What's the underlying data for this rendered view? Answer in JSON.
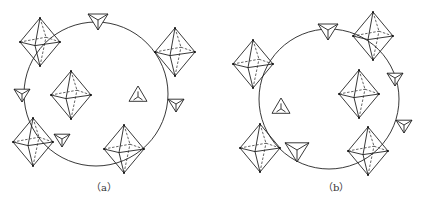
{
  "figure": {
    "panels": [
      {
        "label": "（a）",
        "circle": {
          "cx": 96,
          "cy": 94,
          "r": 72
        },
        "octahedra": [
          [
            40,
            42,
            20,
            24
          ],
          [
            175,
            52,
            20,
            24
          ],
          [
            71,
            95,
            20,
            24
          ],
          [
            33,
            142,
            20,
            24
          ],
          [
            124,
            149,
            20,
            24
          ]
        ],
        "tetrahedra_out": [
          [
            98,
            20,
            10
          ],
          [
            22,
            94,
            8
          ],
          [
            176,
            104,
            8
          ],
          [
            62,
            139,
            8
          ]
        ],
        "tetrahedra_in": [
          [
            138,
            95,
            9
          ]
        ]
      },
      {
        "label": "（b）",
        "circle": {
          "cx": 329,
          "cy": 99,
          "r": 70
        },
        "octahedra": [
          [
            253,
            64,
            20,
            24
          ],
          [
            373,
            36,
            20,
            24
          ],
          [
            359,
            94,
            20,
            24
          ],
          [
            260,
            148,
            20,
            24
          ],
          [
            368,
            151,
            20,
            24
          ]
        ],
        "tetrahedra_out": [
          [
            328,
            30,
            10
          ],
          [
            395,
            78,
            8
          ],
          [
            404,
            125,
            8
          ],
          [
            297,
            150,
            12
          ]
        ],
        "tetrahedra_in": [
          [
            281,
            107,
            9
          ]
        ]
      }
    ]
  }
}
